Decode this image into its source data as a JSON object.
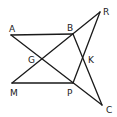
{
  "diagram": {
    "title": "",
    "points": {
      "A": {
        "label": "A",
        "x": 11,
        "y": 35
      },
      "B": {
        "label": "B",
        "x": 73,
        "y": 34
      },
      "R": {
        "label": "R",
        "x": 100,
        "y": 12
      },
      "M": {
        "label": "M",
        "x": 12,
        "y": 83
      },
      "P": {
        "label": "P",
        "x": 73,
        "y": 83
      },
      "C": {
        "label": "C",
        "x": 102,
        "y": 105
      },
      "G": {
        "label": "G",
        "x": 42,
        "y": 60
      },
      "K": {
        "label": "K",
        "x": 83,
        "y": 57
      }
    },
    "segments": [
      [
        "A",
        "B"
      ],
      [
        "M",
        "P"
      ],
      [
        "A",
        "C"
      ],
      [
        "M",
        "R"
      ],
      [
        "B",
        "C"
      ],
      [
        "P",
        "R"
      ]
    ],
    "label_positions": {
      "A": {
        "x": 9,
        "y": 32
      },
      "B": {
        "x": 67,
        "y": 31
      },
      "R": {
        "x": 103,
        "y": 15
      },
      "M": {
        "x": 10,
        "y": 96
      },
      "P": {
        "x": 67,
        "y": 96
      },
      "C": {
        "x": 106,
        "y": 113
      },
      "G": {
        "x": 28,
        "y": 63
      },
      "K": {
        "x": 88,
        "y": 63
      }
    }
  }
}
